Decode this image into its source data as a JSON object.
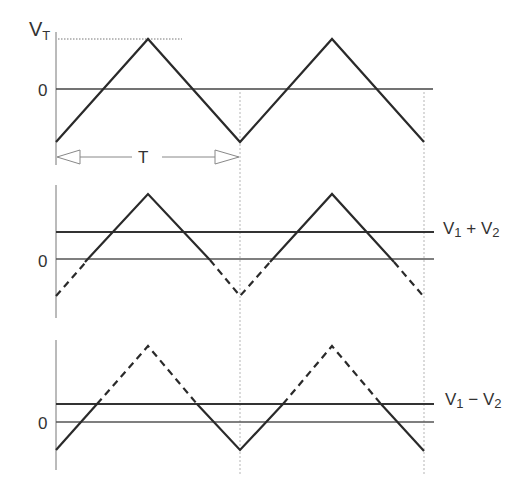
{
  "figure": {
    "type": "triangular-wave-comparator-diagram",
    "panel1": {
      "y_label_peak": "V",
      "y_label_peak_sub": "T",
      "zero_label": "0",
      "period_label": "T"
    },
    "panel2": {
      "zero_label": "0",
      "threshold_label": "V",
      "threshold_sub1": "1",
      "threshold_op": " + V",
      "threshold_sub2": "2"
    },
    "panel3": {
      "zero_label": "0",
      "threshold_label": "V",
      "threshold_sub1": "1",
      "threshold_op": " − V",
      "threshold_sub2": "2"
    },
    "colors": {
      "wave": "#2a2a2a",
      "axis": "#555555",
      "guide": "#aaaaaa"
    }
  }
}
